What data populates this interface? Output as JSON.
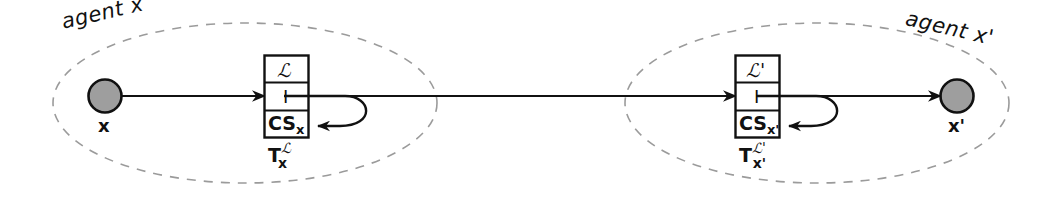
{
  "figure": {
    "background": "#ffffff",
    "stroke_color": "#111111",
    "dashed_color": "#9b9b9b",
    "node_fill": "#9e9e9e"
  },
  "agents": [
    {
      "group_label": "agent x",
      "node_label": "x",
      "box": {
        "row_top": "ℒ",
        "row_mid": "I",
        "row_bottom_text": "CS",
        "row_bottom_sub": "x"
      },
      "caption": {
        "base": "T",
        "superscript": "ℒ",
        "subscript": "x"
      }
    },
    {
      "group_label": "agent x'",
      "node_label": "x'",
      "box": {
        "row_top": "ℒ'",
        "row_mid": "I",
        "row_bottom_text": "CS",
        "row_bottom_sub": "x'"
      },
      "caption": {
        "base": "T",
        "superscript": "ℒ'",
        "subscript": "x'"
      }
    }
  ],
  "edges": [
    {
      "name": "x-to-box1",
      "from": "x",
      "to": "T-x"
    },
    {
      "name": "box1-self-loop",
      "from": "I",
      "to": "CS-x"
    },
    {
      "name": "box1-to-box2",
      "from": "T-x",
      "to": "T-x-prime"
    },
    {
      "name": "box2-self-loop",
      "from": "I",
      "to": "CS-x-prime"
    },
    {
      "name": "box2-to-x-prime",
      "from": "T-x-prime",
      "to": "x'"
    }
  ]
}
